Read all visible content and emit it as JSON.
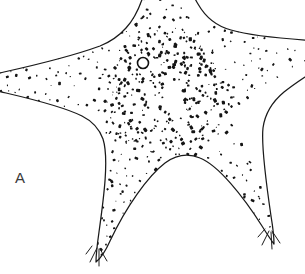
{
  "figure": {
    "domain_kind": "scientific-illustration",
    "panel_label": "A",
    "background_color": "#ffffff",
    "ink_color": "#1a1a1a",
    "label_color": "#3a3a3a",
    "canvas": {
      "width": 305,
      "height": 274
    },
    "rendering": {
      "technique": "pen-and-ink line drawing with stipple shading",
      "line_width": 1.25,
      "fill": "#ffffff"
    },
    "features": [
      {
        "name": "central-disc",
        "center_x": 165,
        "center_y": 95,
        "radius": 52
      },
      {
        "name": "madreporite",
        "center_x": 143,
        "center_y": 63,
        "radius": 5.5
      }
    ],
    "arms": [
      {
        "name": "arm-top",
        "tip_x": 150,
        "tip_y": -30,
        "cropped_by_edge": "top"
      },
      {
        "name": "arm-upper-right",
        "tip_x": 330,
        "tip_y": 18,
        "cropped_by_edge": "right"
      },
      {
        "name": "arm-lower-right",
        "tip_x": 272,
        "tip_y": 242,
        "cropped_by_edge": "none"
      },
      {
        "name": "arm-lower-left",
        "tip_x": 100,
        "tip_y": 258,
        "cropped_by_edge": "none"
      },
      {
        "name": "arm-left",
        "tip_x": -26,
        "tip_y": 80,
        "cropped_by_edge": "left"
      }
    ],
    "interradial_notches": [
      {
        "name": "notch-top-right",
        "x": 207,
        "y": 24
      },
      {
        "name": "notch-right",
        "x": 258,
        "y": 118
      },
      {
        "name": "notch-bottom",
        "x": 205,
        "y": 162
      },
      {
        "name": "notch-left",
        "x": 92,
        "y": 128
      },
      {
        "name": "notch-upper-left",
        "x": 104,
        "y": 44
      }
    ],
    "spine_tufts": [
      {
        "name": "spine-tuft-lower-left",
        "x": 99,
        "y": 252
      },
      {
        "name": "spine-tuft-lower-right",
        "x": 270,
        "y": 234
      }
    ],
    "stipple": {
      "description": "dense irregular dark granule marks covering the body, arranged in radiating rows along each arm, sparser toward arm tips",
      "count": 760,
      "min_size": 1.0,
      "max_size": 3.4,
      "color": "#151515"
    }
  }
}
